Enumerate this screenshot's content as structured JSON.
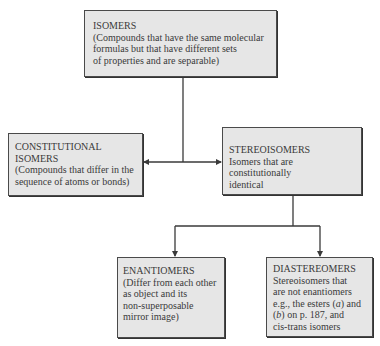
{
  "diagram": {
    "nodes": {
      "isomers": {
        "title": "ISOMERS",
        "description": "(Compounds that have the same molecular\nformulas but that have different sets\nof properties and are separable)"
      },
      "constitutional_isomers": {
        "title": "CONSTITUTIONAL\nISOMERS",
        "description": "(Compounds that differ in the\nsequence of atoms or bonds)"
      },
      "stereoisomers": {
        "title": "STEREOISOMERS",
        "description": "Isomers that are constitutionally\nidentical"
      },
      "enantiomers": {
        "title": "ENANTIOMERS",
        "description": "(Differ from each other\nas object and its\nnon-superposable\nmirror image)"
      },
      "diastereomers": {
        "title": "DIASTEREOMERS",
        "description_parts": [
          "Stereoisomers that\nare not enantiomers\ne.g., the esters (",
          "a",
          ") and\n(",
          "b",
          ") on p. 187, and\ncis-trans isomers"
        ]
      }
    },
    "edges": [
      {
        "from": "isomers",
        "to": "constitutional_isomers"
      },
      {
        "from": "isomers",
        "to": "stereoisomers"
      },
      {
        "from": "stereoisomers",
        "to": "enantiomers"
      },
      {
        "from": "stereoisomers",
        "to": "diastereomers"
      }
    ],
    "colors": {
      "box_fill": "#e6e6e6",
      "box_border": "#4a4a4a",
      "line": "#3a3a3a",
      "text": "#3a3a3a"
    }
  }
}
